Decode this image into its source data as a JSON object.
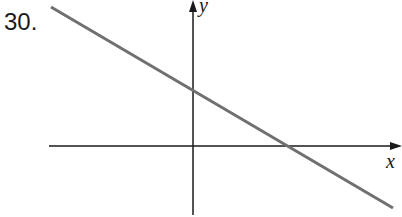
{
  "problem_number": "30.",
  "axes": {
    "x_label": "x",
    "y_label": "y"
  },
  "line": {
    "description": "straight line with negative slope, positive y-intercept and positive x-intercept",
    "slope_sign": "negative",
    "y_intercept_sign": "positive",
    "x_intercept_sign": "positive",
    "color": "#707070"
  },
  "colors": {
    "axis": "#1a1a1a",
    "line": "#707070",
    "background": "#ffffff"
  }
}
